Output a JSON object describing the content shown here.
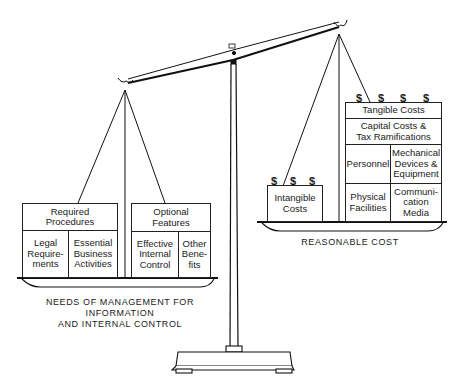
{
  "diagram": {
    "left_pan": {
      "caption_line1": "NEEDS OF MANAGEMENT FOR INFORMATION",
      "caption_line2": "AND INTERNAL CONTROL",
      "required": {
        "header_line1": "Required",
        "header_line2": "Procedures",
        "items": [
          {
            "line1": "Legal",
            "line2": "Require-",
            "line3": "ments"
          },
          {
            "line1": "Essential",
            "line2": "Business",
            "line3": "Activities"
          }
        ]
      },
      "optional": {
        "header_line1": "Optional",
        "header_line2": "Features",
        "items": [
          {
            "line1": "Effective",
            "line2": "Internal",
            "line3": "Control"
          },
          {
            "line1": "Other",
            "line2": "Bene-",
            "line3": "fits"
          }
        ]
      }
    },
    "right_pan": {
      "caption": "REASONABLE COST",
      "intangible": {
        "line1": "Intangible",
        "line2": "Costs",
        "dollar_symbols": [
          "$",
          "$",
          "$"
        ]
      },
      "tangible": {
        "header": "Tangible Costs",
        "dollar_symbols": [
          "$",
          "$",
          "$",
          "$"
        ],
        "capital_line1": "Capital Costs &",
        "capital_line2": "Tax Ramifications",
        "personnel": "Personnel",
        "mechanical_line1": "Mechanical",
        "mechanical_line2": "Devices &",
        "mechanical_line3": "Equipment",
        "physical_line1": "Physical",
        "physical_line2": "Facilities",
        "communication_line1": "Communi-",
        "communication_line2": "cation",
        "communication_line3": "Media"
      }
    }
  }
}
